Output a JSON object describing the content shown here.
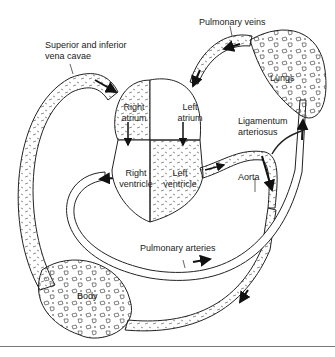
{
  "diagram": {
    "labels": {
      "vena_cavae_line1": "Superior and inferior",
      "vena_cavae_line2": "vena cavae",
      "pulmonary_veins": "Pulmonary veins",
      "lungs": "Lungs",
      "right_atrium_line1": "Right",
      "right_atrium_line2": "atrium",
      "left_atrium_line1": "Left",
      "left_atrium_line2": "atrium",
      "ligamentum_line1": "Ligamentum",
      "ligamentum_line2": "arteriosus",
      "right_ventricle_line1": "Right",
      "right_ventricle_line2": "ventricle",
      "left_ventricle_line1": "Left",
      "left_ventricle_line2": "ventricle",
      "aorta": "Aorta",
      "pulmonary_arteries": "Pulmonary arteries",
      "body": "Body"
    },
    "nodes": [
      "Superior and inferior vena cavae",
      "Right atrium",
      "Right ventricle",
      "Pulmonary arteries",
      "Lungs",
      "Pulmonary veins",
      "Left atrium",
      "Left ventricle",
      "Aorta",
      "Body",
      "Ligamentum arteriosus"
    ],
    "edges": [
      {
        "from": "Superior and inferior vena cavae",
        "to": "Right atrium"
      },
      {
        "from": "Right atrium",
        "to": "Right ventricle"
      },
      {
        "from": "Right ventricle",
        "to": "Pulmonary arteries"
      },
      {
        "from": "Pulmonary arteries",
        "to": "Lungs"
      },
      {
        "from": "Lungs",
        "to": "Pulmonary veins"
      },
      {
        "from": "Pulmonary veins",
        "to": "Left atrium"
      },
      {
        "from": "Left atrium",
        "to": "Left ventricle"
      },
      {
        "from": "Left ventricle",
        "to": "Aorta"
      },
      {
        "from": "Aorta",
        "to": "Body"
      },
      {
        "from": "Body",
        "to": "Superior and inferior vena cavae"
      }
    ],
    "colors": {
      "line": "#222222",
      "background": "#ffffff",
      "rule": "#777777"
    }
  }
}
